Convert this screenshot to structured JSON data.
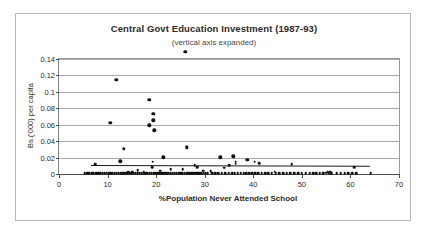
{
  "chart_data": {
    "type": "scatter",
    "title": "Central Govt Education Investment (1987-93)",
    "subtitle": "(vertical axis expanded)",
    "xlabel": "%Population Never Attended School",
    "ylabel": "Bs.('000) per capita",
    "xlim": [
      0,
      70
    ],
    "ylim": [
      0,
      0.15
    ],
    "xticks": [
      0,
      10,
      20,
      30,
      40,
      50,
      60,
      70
    ],
    "xtick_labels": [
      "0",
      "10",
      "20",
      "30",
      "40",
      "50",
      "60",
      "70"
    ],
    "yticks": [
      0,
      0.02,
      0.04,
      0.06,
      0.08,
      0.1,
      0.12,
      0.14
    ],
    "ytick_labels": [
      "0",
      "0.02",
      "0.04",
      "0.06",
      "0.08",
      "0.1",
      "0.12",
      "0.14"
    ],
    "grid": "horizontal",
    "legend": "none",
    "marker_color": "#111111",
    "gridline_color": "#a9a9a9",
    "axis_color": "#4d4d4d",
    "trendline": {
      "color": "#1a1a1a",
      "x_start": 6.5,
      "y_start": 0.0104,
      "x_end": 64.0,
      "y_end": 0.0096
    },
    "points": [
      [
        26.0,
        0.149
      ],
      [
        11.8,
        0.1145
      ],
      [
        18.6,
        0.0905
      ],
      [
        19.4,
        0.0735
      ],
      [
        19.4,
        0.0655
      ],
      [
        18.6,
        0.0595
      ],
      [
        10.6,
        0.0625
      ],
      [
        19.6,
        0.053
      ],
      [
        26.3,
        0.0325
      ],
      [
        13.4,
        0.031
      ],
      [
        21.5,
        0.0205
      ],
      [
        33.2,
        0.0203
      ],
      [
        35.9,
        0.0215
      ],
      [
        38.8,
        0.0175
      ],
      [
        19.3,
        0.015
      ],
      [
        12.6,
        0.0153
      ],
      [
        36.4,
        0.015
      ],
      [
        40.3,
        0.015
      ],
      [
        41.2,
        0.0135
      ],
      [
        36.4,
        0.0125
      ],
      [
        47.9,
        0.012
      ],
      [
        7.4,
        0.0118
      ],
      [
        27.9,
        0.011
      ],
      [
        35.0,
        0.011
      ],
      [
        60.8,
        0.0082
      ],
      [
        19.2,
        0.0085
      ],
      [
        28.4,
        0.008
      ],
      [
        34.0,
        0.0075
      ],
      [
        25.5,
        0.0062
      ],
      [
        23.0,
        0.0055
      ],
      [
        16.2,
        0.0048
      ],
      [
        29.7,
        0.004
      ],
      [
        20.8,
        0.0038
      ],
      [
        31.2,
        0.0035
      ],
      [
        44.4,
        0.003
      ],
      [
        55.3,
        0.0028
      ],
      [
        55.8,
        0.0026
      ],
      [
        17.4,
        0.0025
      ],
      [
        14.3,
        0.0022
      ],
      [
        15.1,
        0.002
      ],
      [
        5.3,
        0.0012
      ],
      [
        5.8,
        0.001
      ],
      [
        6.2,
        0.0011
      ],
      [
        6.8,
        0.0009
      ],
      [
        7.1,
        0.0012
      ],
      [
        7.6,
        0.0008
      ],
      [
        8.1,
        0.001
      ],
      [
        8.5,
        0.0011
      ],
      [
        9.0,
        0.0009
      ],
      [
        9.4,
        0.0013
      ],
      [
        9.8,
        0.0008
      ],
      [
        10.2,
        0.001
      ],
      [
        10.6,
        0.0012
      ],
      [
        11.0,
        0.0008
      ],
      [
        11.5,
        0.0011
      ],
      [
        11.9,
        0.0009
      ],
      [
        12.3,
        0.0013
      ],
      [
        12.8,
        0.0008
      ],
      [
        13.2,
        0.001
      ],
      [
        13.6,
        0.0012
      ],
      [
        14.0,
        0.0009
      ],
      [
        14.5,
        0.0011
      ],
      [
        14.9,
        0.0008
      ],
      [
        15.4,
        0.0013
      ],
      [
        15.8,
        0.001
      ],
      [
        16.2,
        0.0009
      ],
      [
        16.6,
        0.0012
      ],
      [
        17.0,
        0.0008
      ],
      [
        17.5,
        0.0011
      ],
      [
        17.9,
        0.001
      ],
      [
        18.3,
        0.0009
      ],
      [
        18.7,
        0.0013
      ],
      [
        19.1,
        0.0008
      ],
      [
        19.6,
        0.0011
      ],
      [
        20.0,
        0.001
      ],
      [
        20.4,
        0.0009
      ],
      [
        20.8,
        0.0012
      ],
      [
        21.3,
        0.0008
      ],
      [
        21.7,
        0.0011
      ],
      [
        22.1,
        0.001
      ],
      [
        22.5,
        0.0009
      ],
      [
        23.0,
        0.0013
      ],
      [
        23.4,
        0.0008
      ],
      [
        23.8,
        0.0011
      ],
      [
        24.2,
        0.001
      ],
      [
        24.7,
        0.0009
      ],
      [
        25.1,
        0.0012
      ],
      [
        25.5,
        0.0008
      ],
      [
        25.9,
        0.0011
      ],
      [
        26.4,
        0.001
      ],
      [
        26.8,
        0.0009
      ],
      [
        27.2,
        0.0013
      ],
      [
        27.6,
        0.0008
      ],
      [
        28.1,
        0.0011
      ],
      [
        28.5,
        0.001
      ],
      [
        28.9,
        0.0009
      ],
      [
        29.3,
        0.0012
      ],
      [
        29.8,
        0.0008
      ],
      [
        30.2,
        0.0011
      ],
      [
        30.6,
        0.001
      ],
      [
        31.5,
        0.0009
      ],
      [
        32.1,
        0.0012
      ],
      [
        32.8,
        0.0008
      ],
      [
        33.5,
        0.0011
      ],
      [
        34.2,
        0.001
      ],
      [
        34.9,
        0.0009
      ],
      [
        35.6,
        0.0012
      ],
      [
        36.2,
        0.0008
      ],
      [
        36.8,
        0.0011
      ],
      [
        37.4,
        0.001
      ],
      [
        38.0,
        0.0009
      ],
      [
        38.6,
        0.0013
      ],
      [
        39.2,
        0.0008
      ],
      [
        39.8,
        0.0011
      ],
      [
        40.4,
        0.001
      ],
      [
        41.0,
        0.0009
      ],
      [
        41.7,
        0.0012
      ],
      [
        42.4,
        0.0008
      ],
      [
        43.1,
        0.0011
      ],
      [
        43.8,
        0.001
      ],
      [
        44.6,
        0.0009
      ],
      [
        45.3,
        0.0012
      ],
      [
        46.1,
        0.0008
      ],
      [
        46.9,
        0.0011
      ],
      [
        47.6,
        0.001
      ],
      [
        48.4,
        0.0009
      ],
      [
        49.2,
        0.0012
      ],
      [
        50.0,
        0.0008
      ],
      [
        50.8,
        0.0011
      ],
      [
        51.6,
        0.001
      ],
      [
        52.3,
        0.0009
      ],
      [
        53.0,
        0.0012
      ],
      [
        53.7,
        0.0008
      ],
      [
        54.4,
        0.0011
      ],
      [
        55.0,
        0.0014
      ],
      [
        55.5,
        0.001
      ],
      [
        56.0,
        0.0009
      ],
      [
        57.2,
        0.0012
      ],
      [
        58.0,
        0.0008
      ],
      [
        58.8,
        0.0011
      ],
      [
        59.6,
        0.001
      ],
      [
        60.4,
        0.0009
      ],
      [
        61.2,
        0.0012
      ],
      [
        64.2,
        0.001
      ]
    ]
  }
}
